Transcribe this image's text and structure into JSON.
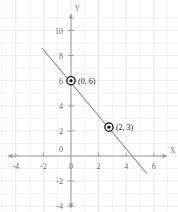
{
  "chart_data": {
    "type": "line",
    "title": "",
    "xlabel": "X",
    "ylabel": "Y",
    "grid": true,
    "legend": "none",
    "xlim": [
      -5.2,
      7.2
    ],
    "ylim": [
      -5.2,
      11.4
    ],
    "x_ticks": [
      -4,
      -2,
      0,
      2,
      4,
      6
    ],
    "x_tick_labels": [
      "-4",
      "-2",
      "0",
      "2",
      "4",
      "6"
    ],
    "y_ticks": [
      -4,
      -2,
      2,
      4,
      6,
      8,
      10
    ],
    "y_tick_labels": [
      "-4",
      "-2",
      "2",
      "4",
      "6",
      "8",
      "10"
    ],
    "x_minor_step": 1,
    "y_minor_step": 1,
    "series": [
      {
        "name": "line",
        "type": "line",
        "x": [
          -2.1,
          5.5
        ],
        "y": [
          8.6,
          -1.4
        ],
        "color": "#9a9a9a",
        "slope": -1.3,
        "intercept": 6
      }
    ],
    "points": [
      {
        "label": "(0, 6)",
        "x": 0,
        "y": 6,
        "marker": "ringed-dot"
      },
      {
        "label": "(2, 3)",
        "x": 2.75,
        "y": 2.3,
        "marker": "ringed-dot"
      }
    ],
    "colors": {
      "background": "#ffffff",
      "grid": "#e8e8e8",
      "axis": "#9a9a9a",
      "line": "#9a9a9a",
      "marker": "#1a1a1a",
      "tick_text": "#6a6a6a",
      "point_text": "#1a1a1a"
    }
  }
}
